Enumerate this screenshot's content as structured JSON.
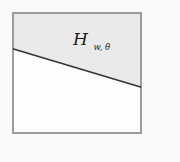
{
  "figure": {
    "label": {
      "base": "H",
      "subscript": "w, θ"
    },
    "colors": {
      "background": "#fafafa",
      "square_fill": "#fdfdfd",
      "square_border": "#9c9c9c",
      "halfspace_shade": "#eaeaea",
      "hyperplane_line": "#333333",
      "label_text": "#1a1a1a"
    }
  }
}
